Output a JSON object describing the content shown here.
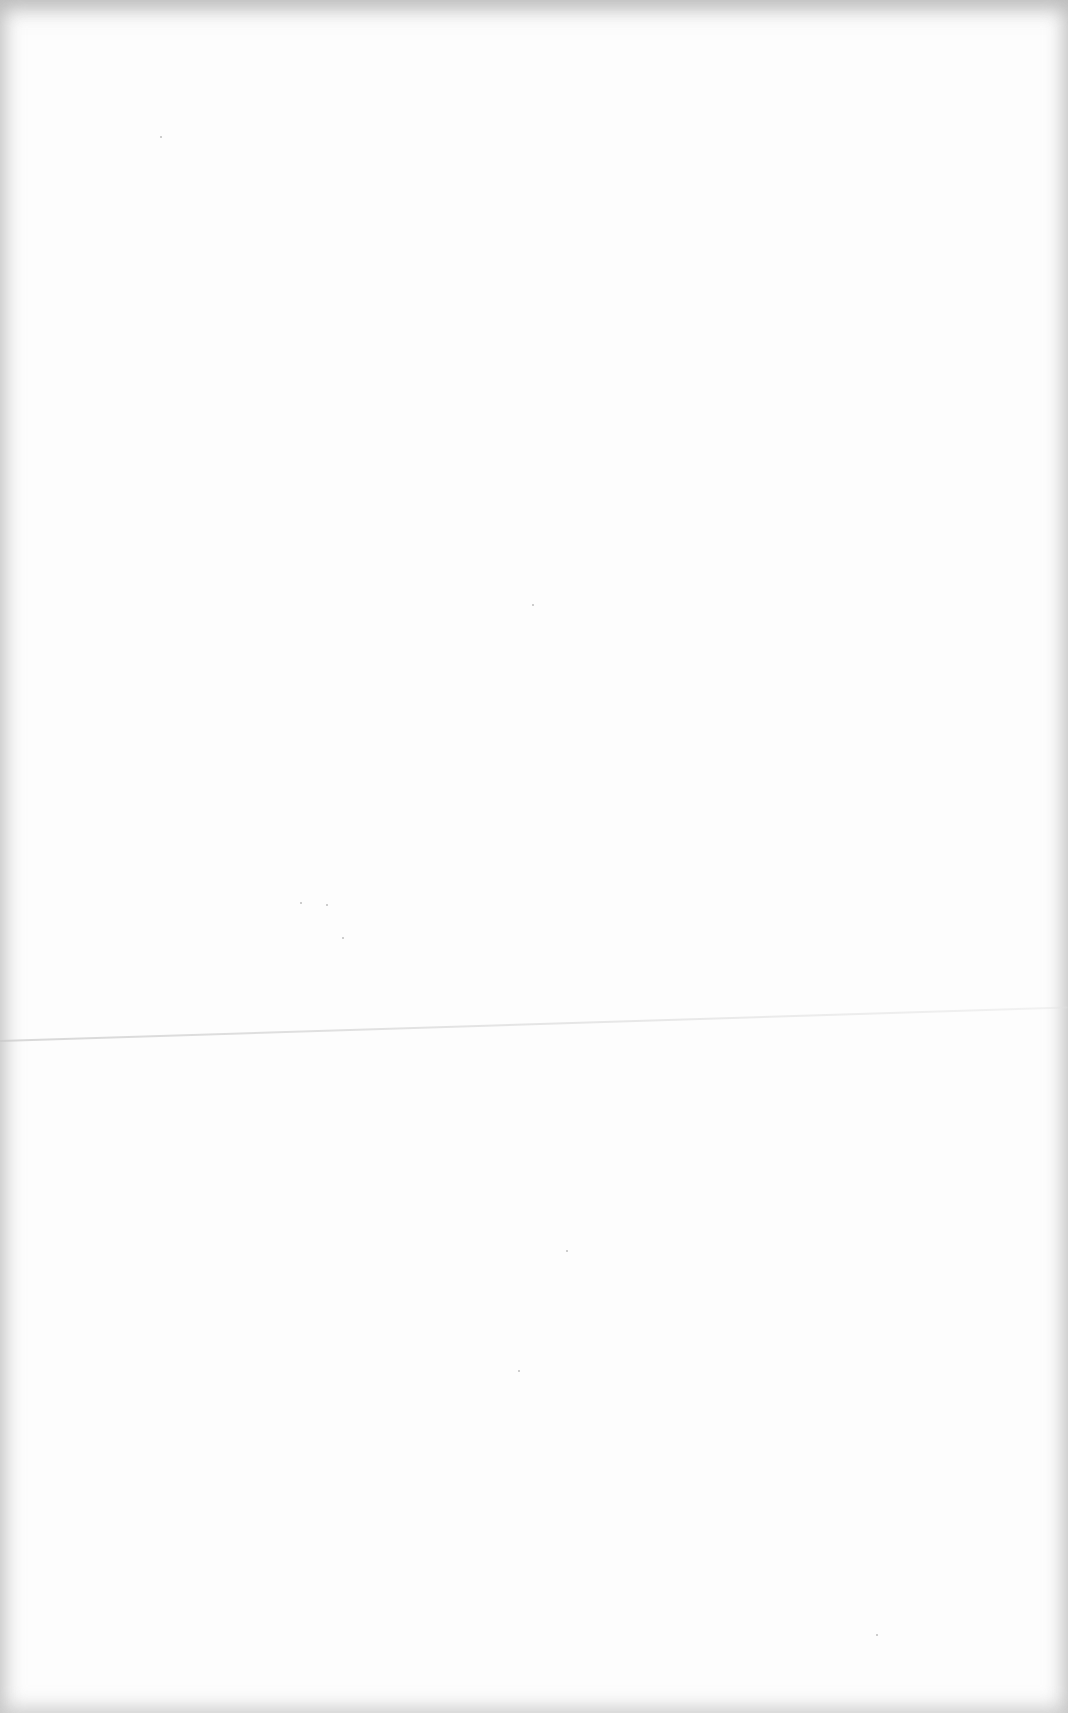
{
  "document": {
    "type": "blank scanned page",
    "text": "",
    "colors": {
      "paper": "#fdfdfd",
      "edge_shading": "#aaaaaa",
      "fold_line": "#d0d0d0"
    }
  }
}
